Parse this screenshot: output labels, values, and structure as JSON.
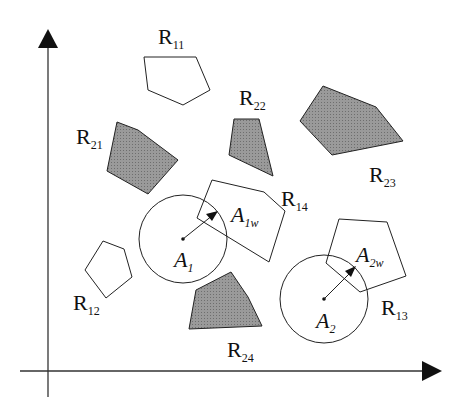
{
  "diagram": {
    "colors": {
      "stroke": "#222222",
      "obstacle_fill": "#8a8a8a",
      "background": "#ffffff"
    },
    "axes": {
      "x_axis": "horizontal arrow",
      "y_axis": "vertical arrow"
    },
    "regions": [
      {
        "id": "R11",
        "base": "R",
        "sub": "11",
        "filled": false
      },
      {
        "id": "R12",
        "base": "R",
        "sub": "12",
        "filled": false
      },
      {
        "id": "R13",
        "base": "R",
        "sub": "13",
        "filled": false
      },
      {
        "id": "R14",
        "base": "R",
        "sub": "14",
        "filled": false
      },
      {
        "id": "R21",
        "base": "R",
        "sub": "21",
        "filled": true
      },
      {
        "id": "R22",
        "base": "R",
        "sub": "22",
        "filled": true
      },
      {
        "id": "R23",
        "base": "R",
        "sub": "23",
        "filled": true
      },
      {
        "id": "R24",
        "base": "R",
        "sub": "24",
        "filled": true
      }
    ],
    "agents": [
      {
        "id": "A1",
        "base": "A",
        "sub": "1",
        "target_label_base": "A",
        "target_label_sub": "1w"
      },
      {
        "id": "A2",
        "base": "A",
        "sub": "2",
        "target_label_base": "A",
        "target_label_sub": "2w"
      }
    ]
  }
}
